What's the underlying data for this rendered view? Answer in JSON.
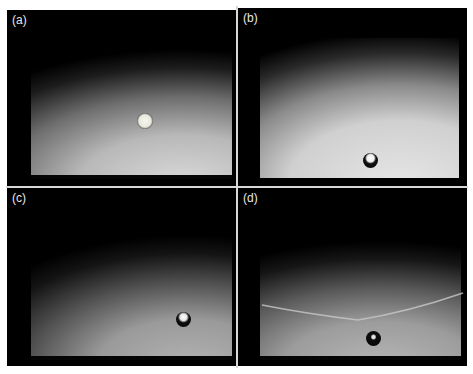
{
  "figure": {
    "panels": [
      {
        "id": "a",
        "label": "(a)",
        "description": "translucent sphere mid-frame on illuminated background"
      },
      {
        "id": "b",
        "label": "(b)",
        "description": "dark sphere with bright highlight near bottom"
      },
      {
        "id": "c",
        "label": "(c)",
        "description": "dark sphere with bright highlight lower right"
      },
      {
        "id": "d",
        "label": "(d)",
        "description": "dark sphere below a faint bright streak across the frame"
      }
    ],
    "colors": {
      "background": "#000000",
      "illuminated": "#c8c8c8",
      "divider": "#d8d8d8",
      "label": "#e8e8e8"
    }
  }
}
